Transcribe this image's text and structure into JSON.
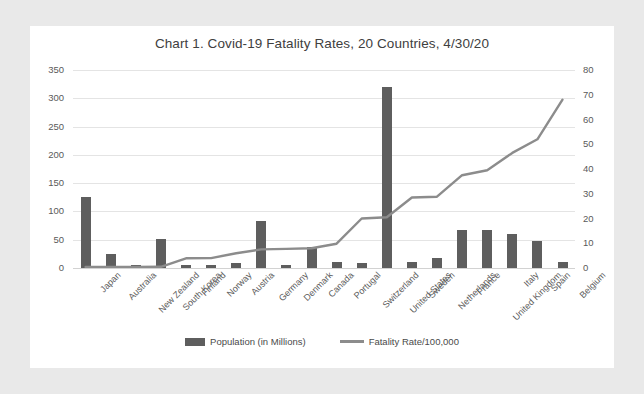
{
  "chart_data": {
    "type": "bar",
    "title": "Chart 1. Covid-19 Fatality Rates, 20 Countries, 4/30/20",
    "xlabel": "",
    "ylabel": "",
    "grid": true,
    "legend_position": "bottom",
    "categories": [
      "Japan",
      "Australia",
      "New Zealand",
      "South Korea",
      "Finland",
      "Norway",
      "Austria",
      "Germany",
      "Denmark",
      "Canada",
      "Portugal",
      "Switzerland",
      "United States",
      "Sweden",
      "Netherlands",
      "France",
      "United Kingdom",
      "Italy",
      "Spain",
      "Belgium"
    ],
    "axes": {
      "left": {
        "label": "Population (in Millions)",
        "ylim": [
          0,
          350
        ],
        "ticks": [
          0,
          50,
          100,
          150,
          200,
          250,
          300,
          350
        ]
      },
      "right": {
        "label": "Fatality Rate/100,000",
        "ylim": [
          0,
          80
        ],
        "ticks": [
          0,
          10,
          20,
          30,
          40,
          50,
          60,
          70,
          80
        ]
      }
    },
    "series": [
      {
        "name": "Population (in Millions)",
        "type": "bar",
        "axis": "left",
        "color": "#5e5e5e",
        "values": [
          126,
          25,
          5,
          51,
          6,
          5,
          9,
          83,
          6,
          38,
          10,
          9,
          320,
          10,
          17,
          67,
          67,
          60,
          47,
          11
        ]
      },
      {
        "name": "Fatality Rate/100,000",
        "type": "line",
        "axis": "right",
        "color": "#8c8c8c",
        "values": [
          0.4,
          0.4,
          0.4,
          0.5,
          3.9,
          4.0,
          6.0,
          7.5,
          7.7,
          8.0,
          9.8,
          20.0,
          20.5,
          28.5,
          28.8,
          37.5,
          39.5,
          46.5,
          52.0,
          68.0
        ]
      }
    ]
  },
  "legend": {
    "items": [
      {
        "label": "Population (in Millions)",
        "marker": "bar-swatch"
      },
      {
        "label": "Fatality Rate/100,000",
        "marker": "line-swatch"
      }
    ]
  }
}
